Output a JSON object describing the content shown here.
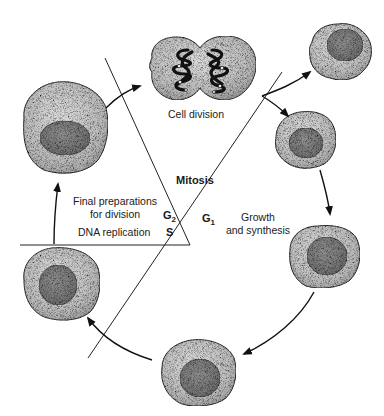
{
  "diagram": {
    "phases": {
      "mitosis": "Mitosis",
      "g1": {
        "letter": "G",
        "sub": "1"
      },
      "g2": {
        "letter": "G",
        "sub": "2"
      },
      "s": "S"
    },
    "descriptions": {
      "cell_division": "Cell division",
      "g1_line1": "Growth",
      "g1_line2": "and synthesis",
      "g2_line1": "Final preparations",
      "g2_line2": "for division",
      "s": "DNA replication"
    },
    "colors": {
      "cytoplasm": "#b8b8b8",
      "nucleus": "#7e7e7e",
      "outline": "#333333",
      "line": "#222222"
    },
    "cells": [
      {
        "id": "dividing",
        "cx": 200,
        "cy": 67
      },
      {
        "id": "daughter-top",
        "cx": 340,
        "cy": 50,
        "r": 30
      },
      {
        "id": "daughter-right",
        "cx": 305,
        "cy": 140,
        "r": 30
      },
      {
        "id": "g1-growing",
        "cx": 325,
        "cy": 255,
        "r": 35
      },
      {
        "id": "g1-bottom",
        "cx": 197,
        "cy": 375,
        "r": 37
      },
      {
        "id": "s-phase",
        "cx": 62,
        "cy": 283,
        "r": 39
      },
      {
        "id": "g2-large",
        "cx": 65,
        "cy": 125,
        "r": 44
      }
    ]
  }
}
